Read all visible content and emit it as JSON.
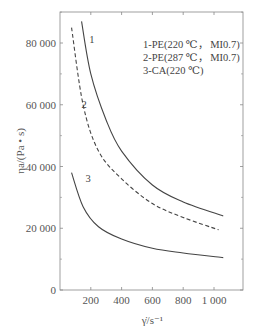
{
  "chart_data": {
    "type": "line",
    "title": "",
    "xlabel": "γ̇/s⁻¹",
    "ylabel": "ηa/(Pa • s)",
    "xlim": [
      0,
      1190
    ],
    "ylim": [
      0,
      92000
    ],
    "x_ticks": [
      "200",
      "400",
      "600",
      "800",
      "1 000"
    ],
    "y_ticks": [
      "0",
      "20 000",
      "40 000",
      "60 000",
      "80 000"
    ],
    "grid": false,
    "legend_position": "top-right",
    "legend": [
      "1-PE(220 ℃， MI0.7)",
      "2-PE(287 ℃， MI0.7)",
      "3-CA(220 ℃)"
    ],
    "series": [
      {
        "name": "1",
        "style": "solid",
        "x": [
          140,
          200,
          300,
          400,
          600,
          800,
          1060
        ],
        "y": [
          87000,
          70000,
          55000,
          45000,
          34000,
          28500,
          24000
        ]
      },
      {
        "name": "2",
        "style": "dashed",
        "x": [
          75,
          150,
          250,
          400,
          600,
          800,
          1030
        ],
        "y": [
          85000,
          60000,
          45000,
          36000,
          28000,
          23500,
          19500
        ]
      },
      {
        "name": "3",
        "style": "solid",
        "x": [
          75,
          150,
          250,
          400,
          600,
          800,
          1060
        ],
        "y": [
          38000,
          27000,
          20500,
          16500,
          13500,
          12000,
          10500
        ]
      }
    ],
    "curve_labels": [
      {
        "text": "1",
        "x": 190,
        "y": 80000
      },
      {
        "text": "2",
        "x": 140,
        "y": 59000
      },
      {
        "text": "3",
        "x": 165,
        "y": 35000
      }
    ]
  }
}
